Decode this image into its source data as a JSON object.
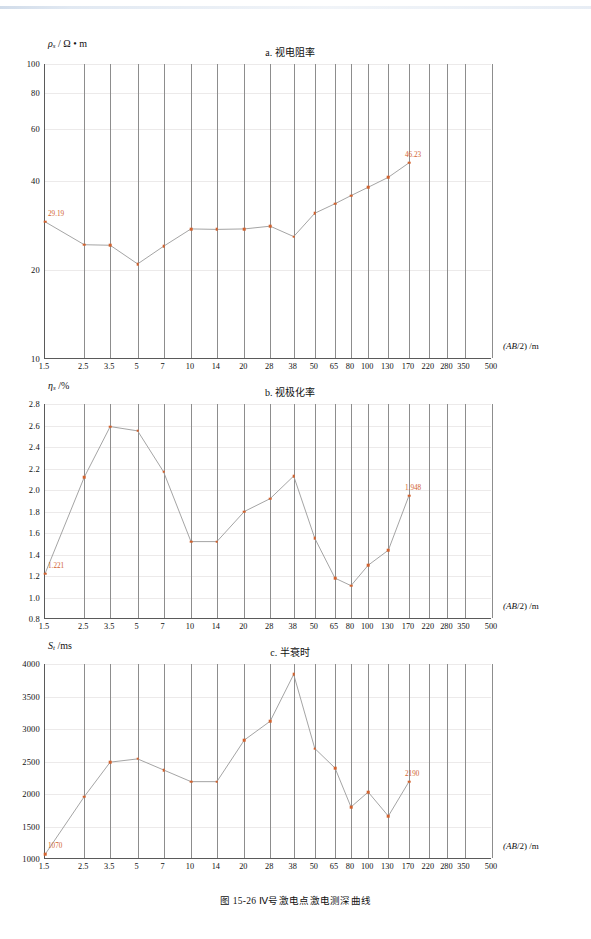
{
  "figure": {
    "caption": "图 15-26   Ⅳ号激电点激电测深曲线",
    "x_axis_title": "(AB/2) /m",
    "x_ticks": [
      "1.5",
      "2.5",
      "3.5",
      "5",
      "7",
      "10",
      "14",
      "20",
      "28",
      "38",
      "50",
      "65",
      "80",
      "100",
      "130",
      "170",
      "220",
      "280",
      "350",
      "500"
    ],
    "x_values": [
      1.5,
      2.5,
      3.5,
      5,
      7,
      10,
      14,
      20,
      28,
      38,
      50,
      65,
      80,
      100,
      130,
      170,
      220,
      280,
      350,
      500
    ],
    "accent_color": "#d2622e",
    "axis_color": "#5a5a5a"
  },
  "chart_data": [
    {
      "type": "line",
      "id": "a",
      "title": "a. 视电阻率",
      "ylabel": "ρs / Ω • m",
      "xlabel": "(AB/2) /m",
      "xscale": "log",
      "yscale": "log",
      "ylim": [
        10,
        100
      ],
      "yticks": [
        10,
        20,
        40,
        60,
        80,
        100
      ],
      "ytick_labels": [
        "10",
        "20",
        "40",
        "60",
        "80",
        "100"
      ],
      "grid": true,
      "x": [
        1.5,
        2.5,
        3.5,
        5,
        7,
        10,
        14,
        20,
        28,
        38,
        50,
        65,
        80,
        100,
        130,
        170
      ],
      "values": [
        29.19,
        24.4,
        24.3,
        21.0,
        24.1,
        27.6,
        27.5,
        27.6,
        28.2,
        26.0,
        31.2,
        33.6,
        35.8,
        38.2,
        41.3,
        46.23
      ],
      "annotations": [
        {
          "index": 0,
          "text": "29.19"
        },
        {
          "index": 15,
          "text": "46.23"
        }
      ]
    },
    {
      "type": "line",
      "id": "b",
      "title": "b. 视极化率",
      "ylabel": "ηs /%",
      "xlabel": "(AB/2) /m",
      "xscale": "log",
      "yscale": "linear",
      "ylim": [
        0.8,
        2.8
      ],
      "yticks": [
        0.8,
        1.0,
        1.2,
        1.4,
        1.6,
        1.8,
        2.0,
        2.2,
        2.4,
        2.6,
        2.8
      ],
      "ytick_labels": [
        "0.8",
        "1.0",
        "1.2",
        "1.4",
        "1.6",
        "1.8",
        "2.0",
        "2.2",
        "2.4",
        "2.6",
        "2.8"
      ],
      "grid": true,
      "x": [
        1.5,
        2.5,
        3.5,
        5,
        7,
        10,
        14,
        20,
        28,
        38,
        50,
        65,
        80,
        100,
        130,
        170
      ],
      "values": [
        1.221,
        2.12,
        2.59,
        2.55,
        2.17,
        1.52,
        1.52,
        1.8,
        1.92,
        2.13,
        1.55,
        1.18,
        1.11,
        1.3,
        1.44,
        1.948
      ],
      "annotations": [
        {
          "index": 0,
          "text": "1.221"
        },
        {
          "index": 15,
          "text": "1.948"
        }
      ]
    },
    {
      "type": "line",
      "id": "c",
      "title": "c. 半衰时",
      "ylabel": "St /ms",
      "xlabel": "(AB/2) /m",
      "xscale": "log",
      "yscale": "linear",
      "ylim": [
        1000,
        4000
      ],
      "yticks": [
        1000,
        1500,
        2000,
        2500,
        3000,
        3500,
        4000
      ],
      "ytick_labels": [
        "1000",
        "1500",
        "2000",
        "2500",
        "3000",
        "3500",
        "4000"
      ],
      "grid": true,
      "x": [
        1.5,
        2.5,
        3.5,
        5,
        7,
        10,
        14,
        20,
        28,
        38,
        50,
        65,
        80,
        100,
        130,
        170
      ],
      "values": [
        1070,
        1960,
        2490,
        2540,
        2370,
        2190,
        2190,
        2830,
        3120,
        3840,
        2700,
        2400,
        1800,
        2030,
        1660,
        2190
      ],
      "annotations": [
        {
          "index": 0,
          "text": "1070"
        },
        {
          "index": 15,
          "text": "2190"
        }
      ]
    }
  ]
}
